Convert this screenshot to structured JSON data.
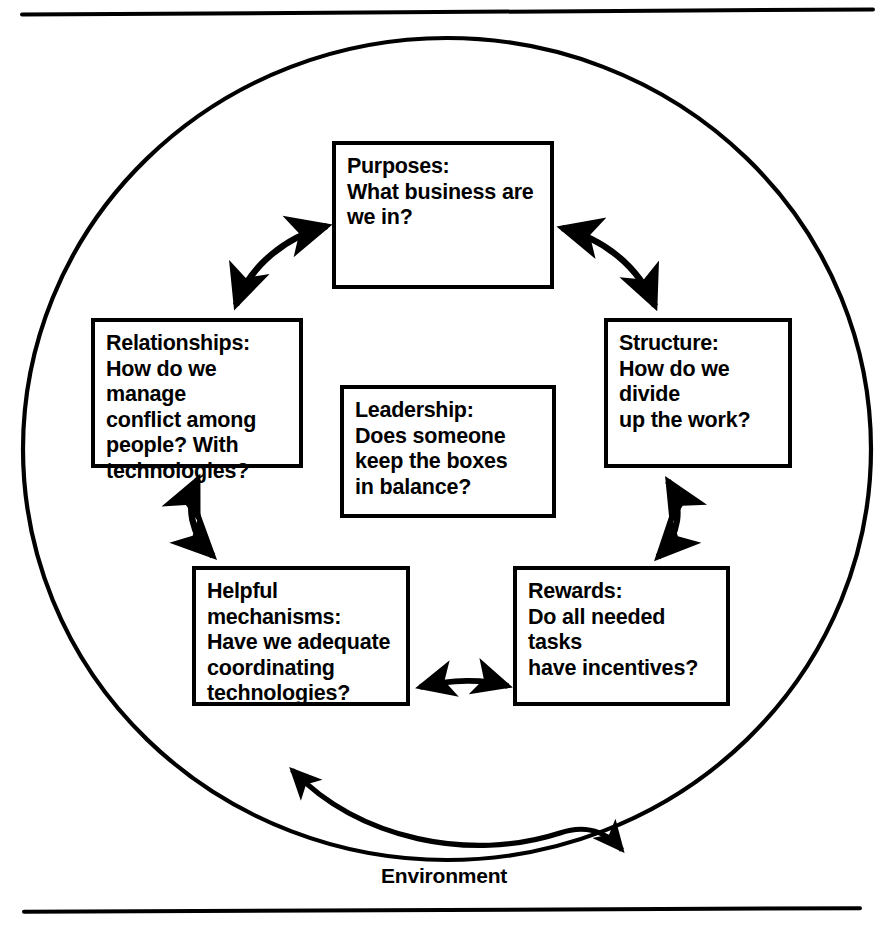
{
  "diagram": {
    "environment_label": "Environment",
    "boxes": [
      {
        "id": "purposes",
        "name": "Purposes",
        "heading": "Purposes:",
        "body": "What business are\nwe in?"
      },
      {
        "id": "relationships",
        "name": "Relationships",
        "heading": "Relationships:",
        "body": "How do we manage\nconflict among\npeople? With\ntechnologies?"
      },
      {
        "id": "leadership",
        "name": "Leadership",
        "heading": "Leadership:",
        "body": "Does someone\nkeep the boxes\nin balance?"
      },
      {
        "id": "structure",
        "name": "Structure",
        "heading": "Structure:",
        "body": "How do we divide\nup the work?"
      },
      {
        "id": "rewards",
        "name": "Rewards",
        "heading": "Rewards:",
        "body": "Do all needed tasks\nhave incentives?"
      },
      {
        "id": "helpful-mechanisms",
        "name": "Helpful mechanisms",
        "heading": "Helpful\nmechanisms:",
        "body": "Have we adequate\ncoordinating\ntechnologies?"
      }
    ],
    "connectors": [
      {
        "id": "relationships-purposes",
        "from": "Relationships",
        "to": "Purposes",
        "style": "double-headed-curved-arrow"
      },
      {
        "id": "purposes-structure",
        "from": "Purposes",
        "to": "Structure",
        "style": "double-headed-curved-arrow"
      },
      {
        "id": "structure-rewards",
        "from": "Structure",
        "to": "Rewards",
        "style": "double-headed-curved-arrow"
      },
      {
        "id": "rewards-helpful",
        "from": "Rewards",
        "to": "Helpful mechanisms",
        "style": "double-headed-curved-arrow"
      },
      {
        "id": "helpful-relationships",
        "from": "Helpful mechanisms",
        "to": "Relationships",
        "style": "double-headed-curved-arrow"
      },
      {
        "id": "environment-exchange",
        "from": "Environment",
        "to": "Organization",
        "style": "double-headed-curved-arrow"
      }
    ],
    "colors": {
      "ink": "#000000",
      "paper": "#ffffff"
    }
  }
}
